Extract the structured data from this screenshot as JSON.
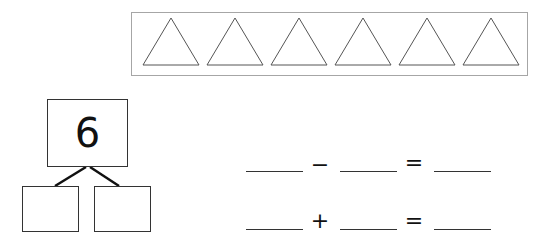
{
  "picture": {
    "shape": "triangle",
    "count": 6,
    "border_color": "#a6a6a6",
    "stroke_color": "#555555"
  },
  "number_bond": {
    "whole": "6",
    "parts": [
      "",
      ""
    ]
  },
  "equations": [
    {
      "blank1": "",
      "operator": "−",
      "blank2": "",
      "equals": "=",
      "result": ""
    },
    {
      "blank1": "",
      "operator": "+",
      "blank2": "",
      "equals": "=",
      "result": ""
    }
  ]
}
